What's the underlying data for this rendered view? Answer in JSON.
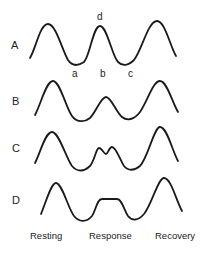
{
  "figure": {
    "rows": [
      {
        "label": "A",
        "description": "three equal peaks"
      },
      {
        "label": "B",
        "description": "reduced middle peak"
      },
      {
        "label": "C",
        "description": "notched double middle peak"
      },
      {
        "label": "D",
        "description": "flattened plateau middle peak"
      }
    ],
    "point_labels": {
      "a": "a",
      "b": "b",
      "c": "c",
      "d": "d"
    },
    "phases": [
      "Resting",
      "Response",
      "Recovery"
    ],
    "line_color": "#1a1a1a",
    "background": "#ffffff"
  }
}
